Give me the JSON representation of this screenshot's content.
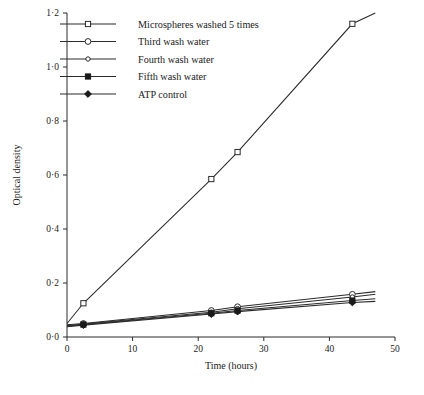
{
  "chart_data": {
    "type": "line",
    "title": "",
    "xlabel": "Time (hours)",
    "ylabel": "Optical density",
    "xlim": [
      0,
      50
    ],
    "ylim": [
      0.0,
      1.2
    ],
    "grid": false,
    "legend_position": "top-left",
    "x_ticks": [
      "0",
      "10",
      "20",
      "30",
      "40",
      "50"
    ],
    "x_tick_values": [
      0,
      10,
      20,
      30,
      40,
      50
    ],
    "y_ticks": [
      "0·0",
      "0·2",
      "0·4",
      "0·6",
      "0·8",
      "1·0",
      "1·2"
    ],
    "y_tick_values": [
      0.0,
      0.2,
      0.4,
      0.6,
      0.8,
      1.0,
      1.2
    ],
    "series": [
      {
        "name": "Microspheres washed  5 times",
        "marker": "open-square",
        "x": [
          0,
          2.5,
          22,
          26,
          43.5,
          47
        ],
        "values": [
          0.05,
          0.125,
          0.585,
          0.685,
          1.16,
          1.2
        ]
      },
      {
        "name": "Third wash water",
        "marker": "open-circle",
        "x": [
          0,
          2.5,
          22,
          26,
          43.5,
          47
        ],
        "values": [
          0.045,
          0.05,
          0.098,
          0.112,
          0.158,
          0.168
        ]
      },
      {
        "name": "Fourth wash water",
        "marker": "open-circle-small",
        "x": [
          0,
          2.5,
          22,
          26,
          43.5,
          47
        ],
        "values": [
          0.042,
          0.048,
          0.092,
          0.105,
          0.148,
          0.158
        ]
      },
      {
        "name": "Fifth wash water",
        "marker": "filled-square",
        "x": [
          0,
          2.5,
          22,
          26,
          43.5,
          47
        ],
        "values": [
          0.04,
          0.046,
          0.088,
          0.098,
          0.135,
          0.142
        ]
      },
      {
        "name": "ATP control",
        "marker": "filled-diamond",
        "x": [
          0,
          2.5,
          22,
          26,
          43.5,
          47
        ],
        "values": [
          0.038,
          0.044,
          0.085,
          0.094,
          0.128,
          0.132
        ]
      }
    ]
  },
  "legend": {
    "entries": [
      {
        "label": "Microspheres washed  5 times",
        "marker": "open-square"
      },
      {
        "label": "Third wash water",
        "marker": "open-circle"
      },
      {
        "label": "Fourth wash water",
        "marker": "open-circle-small"
      },
      {
        "label": "Fifth wash water",
        "marker": "filled-square"
      },
      {
        "label": "ATP control",
        "marker": "filled-diamond"
      }
    ]
  },
  "colors": {
    "line": "#2b2b2b",
    "text": "#1a1a1a",
    "background": "#ffffff"
  }
}
